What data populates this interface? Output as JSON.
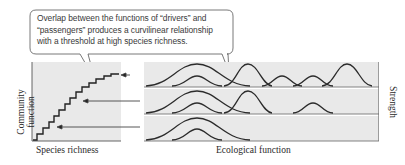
{
  "callout": {
    "lines": [
      "Overlap between the functions of “drivers” and",
      "“passengers” produces a curvilinear relationship",
      "with a threshold at high species richness."
    ]
  },
  "left_panel": {
    "xlabel": "Species richness",
    "ylabel_line1": "Community",
    "ylabel_line2": "function"
  },
  "right_panel": {
    "xlabel": "Ecological function",
    "ylabel": "Strength",
    "strips": [
      {
        "curves": [
          {
            "type": "driver",
            "center": 197
          },
          {
            "type": "passenger",
            "center": 197
          },
          {
            "type": "driver",
            "center": 248
          },
          {
            "type": "passenger",
            "center": 282
          },
          {
            "type": "passenger",
            "center": 313
          },
          {
            "type": "driver",
            "center": 347
          }
        ]
      },
      {
        "curves": [
          {
            "type": "driver",
            "center": 197
          },
          {
            "type": "passenger",
            "center": 197
          },
          {
            "type": "driver",
            "center": 248
          },
          {
            "type": "passenger",
            "center": 313
          }
        ]
      },
      {
        "curves": [
          {
            "type": "driver",
            "center": 197
          },
          {
            "type": "passenger",
            "center": 197
          }
        ]
      }
    ]
  },
  "colors": {
    "panel_bg": "#e9e9e9",
    "line": "#2b2b2b",
    "callout_border": "#555555"
  }
}
